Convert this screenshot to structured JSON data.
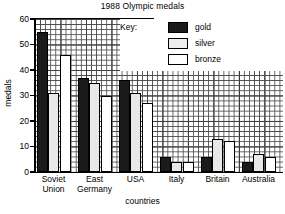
{
  "chart_data": {
    "type": "bar",
    "title": "1988 Olympic medals",
    "xlabel": "countries",
    "ylabel": "medals",
    "categories": [
      "Soviet Union",
      "East Germany",
      "USA",
      "Italy",
      "Britain",
      "Australia"
    ],
    "category_lines": [
      [
        "Soviet",
        "Union"
      ],
      [
        "East",
        "Germany"
      ],
      [
        "USA",
        ""
      ],
      [
        "Italy",
        ""
      ],
      [
        "Britain",
        ""
      ],
      [
        "Australia",
        ""
      ]
    ],
    "series": [
      {
        "name": "gold",
        "values": [
          55,
          37,
          36,
          6,
          6,
          4
        ]
      },
      {
        "name": "silver",
        "values": [
          31,
          35,
          31,
          4,
          13,
          7
        ]
      },
      {
        "name": "bronze",
        "values": [
          46,
          30,
          27,
          4,
          12,
          6
        ]
      }
    ],
    "ylim": [
      0,
      60
    ],
    "yticks": [
      0,
      10,
      20,
      30,
      40,
      50,
      60
    ],
    "ytick_labels": [
      "0",
      "10",
      "20",
      "30",
      "40",
      "50",
      "60"
    ],
    "grid": true,
    "grid_minor_step": 2,
    "grid_major_step": 10,
    "legend_position": "upper right",
    "legend_title": "Key:",
    "legend_entries": [
      {
        "label": "gold",
        "swatch": "gold"
      },
      {
        "label": "silver",
        "swatch": "silver"
      },
      {
        "label": "bronze",
        "swatch": "bronze"
      }
    ],
    "colors": {
      "gold": "#1a1a1a",
      "silver": "#e8e8e8",
      "bronze": "#ffffff",
      "axis": "#000000",
      "grid": "#4a4a4a",
      "background": "#ffffff"
    }
  }
}
